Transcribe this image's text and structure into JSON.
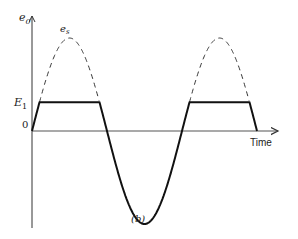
{
  "figure": {
    "caption": "(b)",
    "y_axis_label": "e",
    "y_axis_label_sub": "0",
    "x_axis_label": "Time",
    "sine_label": "e",
    "sine_label_sub": "s",
    "level_label": "E",
    "level_label_sub": "1",
    "origin_label": "0"
  },
  "chart_data": {
    "type": "line",
    "title": "",
    "xlabel": "Time",
    "ylabel": "e0",
    "series": [
      {
        "name": "e_s (input sine, dashed above E1)",
        "style": "dashed",
        "amplitude": 1.0,
        "periods_shown": 1.5
      },
      {
        "name": "e0 (clipped output)",
        "style": "solid",
        "clip_level": 0.31,
        "periods_shown": 1.5
      }
    ],
    "levels": [
      {
        "name": "E1",
        "value": 0.31
      },
      {
        "name": "0",
        "value": 0
      }
    ],
    "ylim": [
      -0.8,
      1.2
    ]
  }
}
